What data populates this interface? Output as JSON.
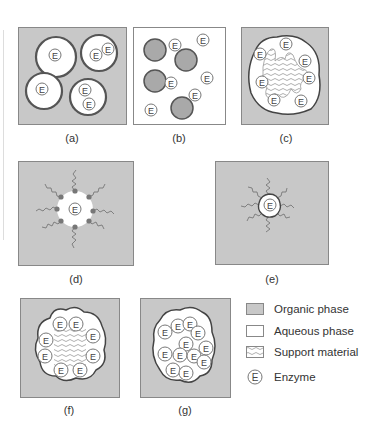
{
  "figure": {
    "colors": {
      "organic_phase": "#c8c8c8",
      "aqueous_phase": "#ffffff",
      "outline": "#555555",
      "support_wave": "#999999",
      "dot": "#777777",
      "filled_droplet": "#a9a9a9"
    },
    "enzyme_symbol": "E",
    "panels": [
      {
        "id": "a",
        "caption": "(a)"
      },
      {
        "id": "b",
        "caption": "(b)"
      },
      {
        "id": "c",
        "caption": "(c)"
      },
      {
        "id": "d",
        "caption": "(d)"
      },
      {
        "id": "e",
        "caption": "(e)"
      },
      {
        "id": "f",
        "caption": "(f)"
      },
      {
        "id": "g",
        "caption": "(g)"
      }
    ]
  },
  "legend": {
    "items": [
      {
        "icon": "organic-phase-swatch",
        "label": "Organic phase"
      },
      {
        "icon": "aqueous-phase-swatch",
        "label": "Aqueous phase"
      },
      {
        "icon": "support-material-swatch",
        "label": "Support material"
      },
      {
        "icon": "enzyme-symbol",
        "label": "Enzyme"
      }
    ]
  }
}
